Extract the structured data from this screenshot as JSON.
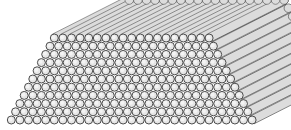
{
  "figure": {
    "rows": 11,
    "bottom_row_count": 29,
    "top_row_count": 19,
    "rod_diameter": 8.6,
    "row_spacing": 8.2,
    "bottom_row_center_y": 120,
    "bottom_row_first_center_x": 11.3,
    "depth_offset": {
      "dx": 75,
      "dy": -38
    },
    "colors": {
      "background": "#ffffff",
      "rod_face": "#e6e6e6",
      "rod_face_highlight": "#f4f4f4",
      "rod_side": "#dcdcdc",
      "outline": "#3a3a3a"
    }
  }
}
